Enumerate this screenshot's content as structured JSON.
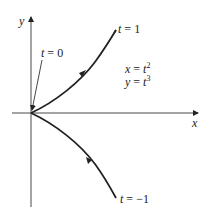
{
  "diagram": {
    "axes": {
      "x_label": "x",
      "y_label": "y"
    },
    "labels": {
      "t0": {
        "var": "t",
        "eq": " = ",
        "val": "0"
      },
      "t1": {
        "var": "t",
        "eq": " = ",
        "val": "1"
      },
      "tneg1": {
        "var": "t",
        "eq": " = ",
        "val": "−1"
      }
    },
    "equations": {
      "x": {
        "lhs": "x",
        "eq": " = ",
        "base": "t",
        "exp": "2"
      },
      "y": {
        "lhs": "y",
        "eq": " = ",
        "base": "t",
        "exp": "3"
      }
    },
    "colors": {
      "stroke": "#222222",
      "background": "#ffffff"
    }
  }
}
